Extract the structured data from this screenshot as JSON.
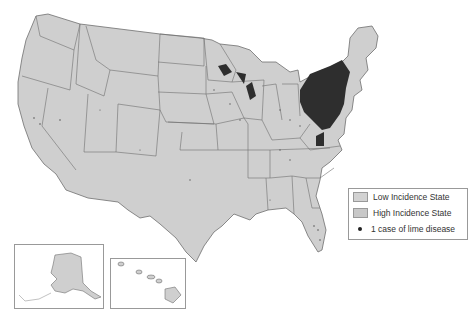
{
  "map": {
    "title": "",
    "colors": {
      "land": "#cfcfcf",
      "border": "#6f6f6f",
      "high_cluster": "#2e2e2e",
      "low_swatch": "#d2d2d2",
      "high_swatch": "#c8c8c8"
    }
  },
  "legend": {
    "items": [
      {
        "label": "Low Incidence State",
        "symbol": "swatch-low"
      },
      {
        "label": "High Incidence State",
        "symbol": "swatch-high"
      },
      {
        "label": "1 case of lime disease",
        "symbol": "dot"
      }
    ]
  },
  "insets": [
    {
      "name": "Alaska"
    },
    {
      "name": "Hawaii"
    }
  ]
}
